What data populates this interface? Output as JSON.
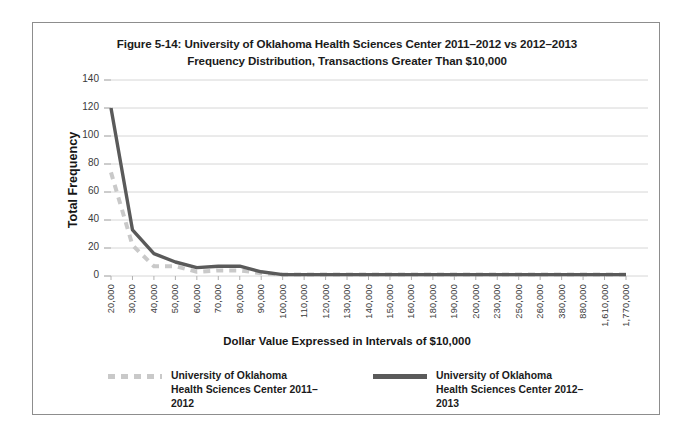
{
  "figure": {
    "title": "Figure 5-14: University of Oklahoma Health Sciences Center 2011–2012 vs 2012–2013 Frequency Distribution, Transactions Greater Than $10,000"
  },
  "legend": {
    "position": "bottom-center",
    "entries": [
      {
        "label": "University of Oklahoma Health Sciences Center 2011–2012",
        "style": "dashed",
        "color": "#c9c9c9"
      },
      {
        "label": "University of Oklahoma Health Sciences Center 2012–2013",
        "style": "solid",
        "color": "#5a5a5a"
      }
    ]
  },
  "chart_data": {
    "type": "line",
    "title": "Figure 5-14: University of Oklahoma Health Sciences Center 2011–2012 vs 2012–2013 Frequency Distribution, Transactions Greater Than $10,000",
    "xlabel": "Dollar Value Expressed in Intervals of $10,000",
    "ylabel": "Total Frequency",
    "grid": true,
    "ylim": [
      0,
      140
    ],
    "yticks": [
      0,
      20,
      40,
      60,
      80,
      100,
      120,
      140
    ],
    "categories": [
      "20,000",
      "30,000",
      "40,000",
      "50,000",
      "60,000",
      "70,000",
      "80,000",
      "90,000",
      "100,000",
      "110,000",
      "120,000",
      "130,000",
      "140,000",
      "150,000",
      "160,000",
      "180,000",
      "190,000",
      "200,000",
      "230,000",
      "250,000",
      "260,000",
      "380,000",
      "880,000",
      "1,610,000",
      "1,770,000"
    ],
    "series": [
      {
        "name": "University of Oklahoma Health Sciences Center 2011–2012",
        "style": "dashed",
        "color": "#c9c9c9",
        "values": [
          74,
          22,
          7,
          7,
          3,
          4,
          4,
          2,
          1,
          1,
          1,
          1,
          1,
          1,
          1,
          1,
          1,
          1,
          1,
          1,
          1,
          1,
          1,
          1,
          1
        ]
      },
      {
        "name": "University of Oklahoma Health Sciences Center 2012–2013",
        "style": "solid",
        "color": "#5a5a5a",
        "values": [
          120,
          33,
          16,
          10,
          6,
          7,
          7,
          3,
          1,
          1,
          1,
          1,
          1,
          1,
          1,
          1,
          1,
          1,
          1,
          1,
          1,
          1,
          1,
          1,
          1
        ]
      }
    ]
  }
}
